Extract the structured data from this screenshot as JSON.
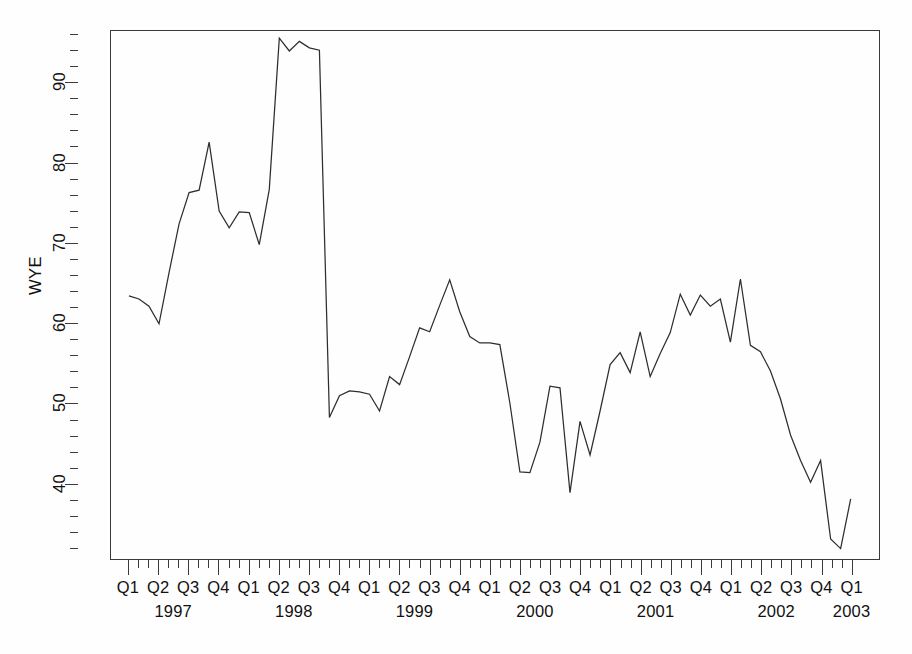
{
  "chart_data": {
    "type": "line",
    "title": "",
    "xlabel": "",
    "ylabel": "WYE",
    "ylim": [
      30.5,
      96.5
    ],
    "y_ticks_major": [
      40,
      50,
      60,
      70,
      80,
      90
    ],
    "y_tick_labels": [
      "40",
      "50",
      "60",
      "70",
      "80",
      "90"
    ],
    "y_minor_step": 2,
    "grid": false,
    "legend": "none",
    "frequency": "monthly",
    "x_start": "1997-01",
    "x_end": "2003-01",
    "quarter_labels": [
      "Q1",
      "Q2",
      "Q3",
      "Q4",
      "Q1",
      "Q2",
      "Q3",
      "Q4",
      "Q1",
      "Q2",
      "Q3",
      "Q4",
      "Q1",
      "Q2",
      "Q3",
      "Q4",
      "Q1",
      "Q2",
      "Q3",
      "Q4",
      "Q1",
      "Q2",
      "Q3",
      "Q4",
      "Q1"
    ],
    "year_labels": [
      "1997",
      "1998",
      "1999",
      "2000",
      "2001",
      "2002",
      "2003"
    ],
    "year_label_positions_quarter_index": [
      1.5,
      5.5,
      9.5,
      13.5,
      17.5,
      21.5,
      24.0
    ],
    "series": [
      {
        "name": "WYE",
        "color": "#2e2e2e",
        "x": [
          "1997-01",
          "1997-02",
          "1997-03",
          "1997-04",
          "1997-05",
          "1997-06",
          "1997-07",
          "1997-08",
          "1997-09",
          "1997-10",
          "1997-11",
          "1997-12",
          "1998-01",
          "1998-02",
          "1998-03",
          "1998-04",
          "1998-05",
          "1998-06",
          "1998-07",
          "1998-08",
          "1998-09",
          "1998-10",
          "1998-11",
          "1998-12",
          "1999-01",
          "1999-02",
          "1999-03",
          "1999-04",
          "1999-05",
          "1999-06",
          "1999-07",
          "1999-08",
          "1999-09",
          "1999-10",
          "1999-11",
          "1999-12",
          "2000-01",
          "2000-02",
          "2000-03",
          "2000-04",
          "2000-05",
          "2000-06",
          "2000-07",
          "2000-08",
          "2000-09",
          "2000-10",
          "2000-11",
          "2000-12",
          "2001-01",
          "2001-02",
          "2001-03",
          "2001-04",
          "2001-05",
          "2001-06",
          "2001-07",
          "2001-08",
          "2001-09",
          "2001-10",
          "2001-11",
          "2001-12",
          "2002-01",
          "2002-02",
          "2002-03",
          "2002-04",
          "2002-05",
          "2002-06",
          "2002-07",
          "2002-08",
          "2002-09",
          "2002-10",
          "2002-11",
          "2002-12",
          "2003-01"
        ],
        "values": [
          63.4,
          63.0,
          62.1,
          59.9,
          66.3,
          72.4,
          76.3,
          76.6,
          82.6,
          74.0,
          71.9,
          73.9,
          73.8,
          69.8,
          76.7,
          95.6,
          94.0,
          95.2,
          94.4,
          94.1,
          48.2,
          50.9,
          51.5,
          51.4,
          51.1,
          49.0,
          53.3,
          52.3,
          55.8,
          59.4,
          58.9,
          62.2,
          65.4,
          61.4,
          58.3,
          57.5,
          57.5,
          57.3,
          50.0,
          41.4,
          41.3,
          45.1,
          52.1,
          51.9,
          38.8,
          47.7,
          43.5,
          49.0,
          54.8,
          56.3,
          53.8,
          58.9,
          53.3,
          56.2,
          58.8,
          63.6,
          61.0,
          63.5,
          62.1,
          63.0,
          57.6,
          59.1,
          63.2,
          57.9,
          56.4,
          58.4,
          56.2,
          58.7,
          61.4,
          64.3,
          63.3,
          65.5,
          57.2
        ]
      }
    ],
    "notes": {
      "peak_value": 95.6,
      "peak_period": "1998-04",
      "min_value": 31.8,
      "min_period": "2002-11"
    },
    "tail_extension": {
      "description": "Post Q1-2002 descent continues to chart right edge",
      "x": [
        "2002-02",
        "2002-03",
        "2002-04",
        "2002-05",
        "2002-06",
        "2002-07",
        "2002-08",
        "2002-09",
        "2002-10",
        "2002-11",
        "2002-12",
        "2003-01"
      ],
      "values": [
        65.5,
        57.2,
        56.4,
        54.0,
        50.5,
        46.0,
        42.8,
        40.1,
        42.8,
        33.0,
        31.8,
        38.0
      ]
    }
  },
  "axes": {
    "y_title": "WYE"
  }
}
